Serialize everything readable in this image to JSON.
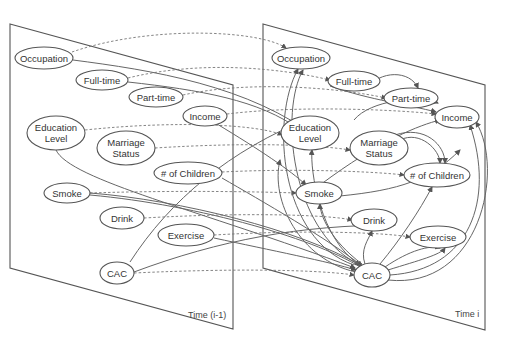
{
  "diagram": {
    "planes": [
      {
        "id": "left",
        "label": "Time (i-1)",
        "points": [
          [
            10,
            24
          ],
          [
            233,
            85
          ],
          [
            233,
            329
          ],
          [
            10,
            268
          ]
        ],
        "label_pos": [
          188,
          318
        ]
      },
      {
        "id": "right",
        "label": "Time i",
        "points": [
          [
            263,
            24
          ],
          [
            485,
            85
          ],
          [
            485,
            330
          ],
          [
            263,
            268
          ]
        ],
        "label_pos": [
          455,
          317
        ]
      }
    ],
    "nodes": [
      {
        "id": "L_occ",
        "lines": [
          "Occupation"
        ],
        "cx": 44,
        "cy": 58,
        "rx": 29,
        "ry": 11
      },
      {
        "id": "L_full",
        "lines": [
          "Full-time"
        ],
        "cx": 102,
        "cy": 80,
        "rx": 26,
        "ry": 10
      },
      {
        "id": "L_part",
        "lines": [
          "Part-time"
        ],
        "cx": 156,
        "cy": 97,
        "rx": 27,
        "ry": 10
      },
      {
        "id": "L_inc",
        "lines": [
          "Income"
        ],
        "cx": 205,
        "cy": 116,
        "rx": 22,
        "ry": 10
      },
      {
        "id": "L_edu",
        "lines": [
          "Education",
          "Level"
        ],
        "cx": 56,
        "cy": 133,
        "rx": 29,
        "ry": 17
      },
      {
        "id": "L_mar",
        "lines": [
          "Marriage",
          "Status"
        ],
        "cx": 126,
        "cy": 148,
        "rx": 29,
        "ry": 17
      },
      {
        "id": "L_chi",
        "lines": [
          "# of Children"
        ],
        "cx": 188,
        "cy": 173,
        "rx": 34,
        "ry": 11
      },
      {
        "id": "L_smo",
        "lines": [
          "Smoke"
        ],
        "cx": 67,
        "cy": 193,
        "rx": 23,
        "ry": 10
      },
      {
        "id": "L_dri",
        "lines": [
          "Drink"
        ],
        "cx": 122,
        "cy": 218,
        "rx": 22,
        "ry": 11
      },
      {
        "id": "L_exe",
        "lines": [
          "Exercise"
        ],
        "cx": 186,
        "cy": 235,
        "rx": 28,
        "ry": 11
      },
      {
        "id": "L_cac",
        "lines": [
          "CAC"
        ],
        "cx": 117,
        "cy": 273,
        "rx": 17,
        "ry": 11
      },
      {
        "id": "R_occ",
        "lines": [
          "Occupation"
        ],
        "cx": 301,
        "cy": 58,
        "rx": 29,
        "ry": 11
      },
      {
        "id": "R_full",
        "lines": [
          "Full-time"
        ],
        "cx": 354,
        "cy": 81,
        "rx": 26,
        "ry": 10
      },
      {
        "id": "R_part",
        "lines": [
          "Part-time"
        ],
        "cx": 411,
        "cy": 98,
        "rx": 27,
        "ry": 10
      },
      {
        "id": "R_inc",
        "lines": [
          "Income"
        ],
        "cx": 457,
        "cy": 117,
        "rx": 22,
        "ry": 11
      },
      {
        "id": "R_edu",
        "lines": [
          "Education",
          "Level"
        ],
        "cx": 310,
        "cy": 133,
        "rx": 29,
        "ry": 17
      },
      {
        "id": "R_mar",
        "lines": [
          "Marriage",
          "Status"
        ],
        "cx": 379,
        "cy": 148,
        "rx": 29,
        "ry": 17
      },
      {
        "id": "R_chi",
        "lines": [
          "# of Children"
        ],
        "cx": 437,
        "cy": 175,
        "rx": 33,
        "ry": 12
      },
      {
        "id": "R_smo",
        "lines": [
          "Smoke"
        ],
        "cx": 319,
        "cy": 193,
        "rx": 23,
        "ry": 11
      },
      {
        "id": "R_dri",
        "lines": [
          "Drink"
        ],
        "cx": 374,
        "cy": 220,
        "rx": 23,
        "ry": 11
      },
      {
        "id": "R_exe",
        "lines": [
          "Exercise"
        ],
        "cx": 438,
        "cy": 237,
        "rx": 28,
        "ry": 11
      },
      {
        "id": "R_cac",
        "lines": [
          "CAC"
        ],
        "cx": 372,
        "cy": 275,
        "rx": 18,
        "ry": 12
      }
    ],
    "edges": [
      {
        "style": "dash",
        "d": "M72,52 C150,25 260,30 286,48"
      },
      {
        "style": "dash",
        "d": "M128,78 C200,60 280,68 330,80"
      },
      {
        "style": "dash",
        "d": "M183,95 C250,80 340,88 386,98"
      },
      {
        "style": "dash",
        "d": "M227,114 C300,105 400,110 436,114"
      },
      {
        "style": "dash",
        "d": "M85,130 C180,120 260,125 282,135"
      },
      {
        "style": "dash",
        "d": "M155,148 C250,142 320,145 350,150"
      },
      {
        "style": "dash",
        "d": "M222,172 C300,168 380,172 404,175"
      },
      {
        "style": "dash",
        "d": "M90,193 C180,190 270,192 296,193"
      },
      {
        "style": "dash",
        "d": "M144,218 C250,212 330,215 352,220"
      },
      {
        "style": "dash",
        "d": "M214,235 C300,230 380,232 410,237"
      },
      {
        "style": "dash",
        "d": "M134,273 C240,268 320,270 354,275"
      },
      {
        "style": "solid",
        "d": "M73,60 C150,70 250,85 320,140"
      },
      {
        "style": "solid",
        "d": "M128,82 C200,90 260,100 300,130"
      },
      {
        "style": "solid",
        "d": "M217,124 C260,150 290,170 306,185"
      },
      {
        "style": "solid",
        "d": "M56,150 C70,180 200,210 355,268"
      },
      {
        "style": "solid",
        "d": "M90,193 C180,200 300,230 360,265"
      },
      {
        "style": "solid",
        "d": "M90,195 C200,205 320,240 365,270"
      },
      {
        "style": "solid",
        "d": "M222,178 C260,200 330,240 362,266"
      },
      {
        "style": "solid",
        "d": "M130,262 C170,200 230,150 310,118"
      },
      {
        "style": "solid",
        "d": "M134,272 C220,240 300,225 395,225"
      },
      {
        "style": "solid",
        "d": "M214,238 C270,250 330,262 356,270"
      },
      {
        "style": "solid",
        "d": "M354,265 C280,240 270,120 298,69"
      },
      {
        "style": "solid",
        "d": "M358,264 C290,230 280,110 303,70"
      },
      {
        "style": "solid",
        "d": "M360,265 C320,240 310,170 312,150"
      },
      {
        "style": "solid",
        "d": "M362,264 C330,240 320,215 320,204"
      },
      {
        "style": "solid",
        "d": "M365,264 C360,250 368,240 372,231"
      },
      {
        "style": "solid",
        "d": "M380,264 C400,240 420,210 432,187"
      },
      {
        "style": "solid",
        "d": "M385,267 C410,250 430,245 440,248"
      },
      {
        "style": "solid",
        "d": "M388,270 C420,260 440,255 445,248"
      },
      {
        "style": "solid",
        "d": "M390,275 C470,270 495,200 470,125"
      },
      {
        "style": "solid",
        "d": "M388,280 C480,290 505,170 476,122"
      },
      {
        "style": "solid",
        "d": "M356,272 C300,260 270,200 280,160"
      },
      {
        "style": "solid",
        "d": "M366,89 C380,70 410,70 418,88"
      },
      {
        "style": "solid",
        "d": "M400,140 C420,130 440,150 440,163"
      },
      {
        "style": "solid",
        "d": "M395,135 C425,125 445,145 445,163"
      },
      {
        "style": "solid",
        "d": "M330,86 C370,100 410,105 436,112"
      },
      {
        "style": "solid",
        "d": "M354,120 C370,100 420,95 438,103"
      },
      {
        "style": "solid",
        "d": "M320,185 C380,140 420,125 440,120"
      },
      {
        "style": "solid",
        "d": "M340,196 C400,190 430,180 460,150"
      }
    ]
  }
}
